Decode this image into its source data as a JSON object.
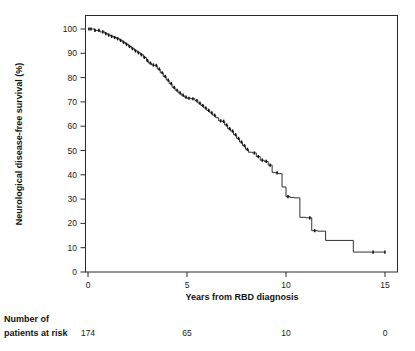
{
  "chart_data": {
    "type": "line",
    "title": "",
    "subtitle": "",
    "xlabel": "Years from RBD diagnosis",
    "ylabel": "Neurological disease-free survival (%)",
    "xlim": [
      0,
      15.6
    ],
    "ylim": [
      0,
      104
    ],
    "grid": false,
    "legend": false,
    "legend_position": "none",
    "curve_style": "kaplan-meier-step-with-censor-ticks",
    "xticks": [
      0,
      5,
      10,
      15
    ],
    "xticklabels": [
      "0",
      "5",
      "10",
      "15"
    ],
    "yticks": [
      0,
      10,
      20,
      30,
      40,
      50,
      60,
      70,
      80,
      90,
      100
    ],
    "yticklabels": [
      "0",
      "10",
      "20",
      "30",
      "40",
      "50",
      "60",
      "70",
      "80",
      "90",
      "100"
    ],
    "series": [
      {
        "name": "Neurological disease-free survival",
        "color": "#1a1a1a",
        "x": [
          0.0,
          0.35,
          0.6,
          0.85,
          1.0,
          1.15,
          1.3,
          1.45,
          1.6,
          1.75,
          1.9,
          2.05,
          2.2,
          2.35,
          2.5,
          2.65,
          2.8,
          2.95,
          3.05,
          3.2,
          3.35,
          3.5,
          3.65,
          3.8,
          3.95,
          4.1,
          4.25,
          4.4,
          4.55,
          4.7,
          4.85,
          5.0,
          5.2,
          5.4,
          5.55,
          5.7,
          5.85,
          6.0,
          6.15,
          6.3,
          6.45,
          6.6,
          6.75,
          6.9,
          7.05,
          7.2,
          7.35,
          7.5,
          7.65,
          7.8,
          7.95,
          8.1,
          8.3,
          8.5,
          8.7,
          8.9,
          9.1,
          9.3,
          9.45,
          9.6,
          9.8,
          10.0,
          10.2,
          10.4,
          10.7,
          11.0,
          11.3,
          11.6,
          12.0,
          13.4,
          15.0
        ],
        "y": [
          100.0,
          99.4,
          98.8,
          98.1,
          97.5,
          97.0,
          96.5,
          96.0,
          95.3,
          94.5,
          93.7,
          92.8,
          91.9,
          91.0,
          90.2,
          89.4,
          88.3,
          87.0,
          86.0,
          85.2,
          85.0,
          83.5,
          82.0,
          80.5,
          79.0,
          77.5,
          76.0,
          74.8,
          73.7,
          72.8,
          72.0,
          71.5,
          71.3,
          70.5,
          69.5,
          68.5,
          67.5,
          66.5,
          65.5,
          64.5,
          63.5,
          62.2,
          62.0,
          60.5,
          59.0,
          58.0,
          56.5,
          55.0,
          53.5,
          52.0,
          50.5,
          49.3,
          49.0,
          47.5,
          46.0,
          45.5,
          44.0,
          41.0,
          40.8,
          40.5,
          35.0,
          31.0,
          30.7,
          30.5,
          22.5,
          22.3,
          17.0,
          16.8,
          13.0,
          8.2,
          8.2
        ],
        "censor_times": [
          0.05,
          0.15,
          0.35,
          0.55,
          0.75,
          0.9,
          1.05,
          1.2,
          1.35,
          1.5,
          1.65,
          1.8,
          1.95,
          2.1,
          2.25,
          2.4,
          2.55,
          2.7,
          2.85,
          3.0,
          3.15,
          3.3,
          3.45,
          3.6,
          3.75,
          3.9,
          4.05,
          4.2,
          4.35,
          4.5,
          4.65,
          4.8,
          4.95,
          5.1,
          5.3,
          5.5,
          5.65,
          5.8,
          5.95,
          6.1,
          6.25,
          6.4,
          6.7,
          6.85,
          7.0,
          7.15,
          7.3,
          7.45,
          7.6,
          7.75,
          7.9,
          8.05,
          8.4,
          8.6,
          8.8,
          9.0,
          9.2,
          9.55,
          10.1,
          11.2,
          11.45,
          14.4,
          15.0
        ]
      }
    ]
  },
  "axes": {
    "y_axis_label": "Neurological disease-free survival (%)",
    "x_axis_label": "Years from RBD diagnosis"
  },
  "risk_table": {
    "header_line1": "Number of",
    "header_line2": "patients at risk",
    "times": [
      0,
      5,
      10,
      15
    ],
    "values": [
      "174",
      "65",
      "10",
      "0"
    ]
  },
  "colors": {
    "curve": "#1a1a1a",
    "axis": "#2b2b2b",
    "text": "#1a1a1a",
    "background": "#ffffff"
  }
}
